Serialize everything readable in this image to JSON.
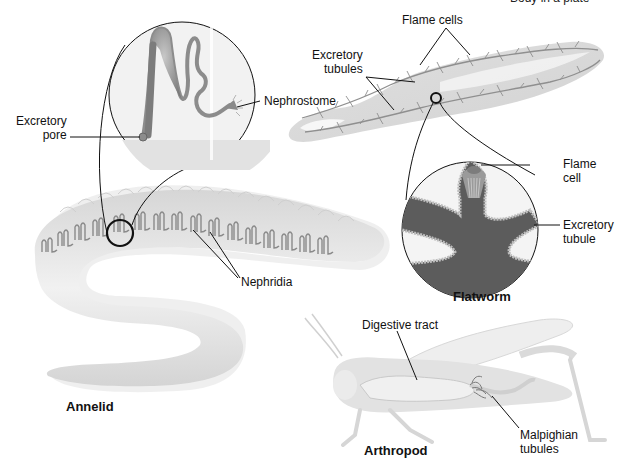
{
  "figure": {
    "top_cut_caption": "Body in a plate",
    "annelid": {
      "title": "Annelid",
      "labels": {
        "excretory_pore": [
          "Excretory",
          "pore"
        ],
        "nephrostome": "Nephrostome",
        "nephridia": "Nephridia"
      }
    },
    "flatworm": {
      "title": "Flatworm",
      "labels": {
        "flame_cells": "Flame cells",
        "excretory_tubules": [
          "Excretory",
          "tubules"
        ],
        "flame_cell": [
          "Flame",
          "cell"
        ],
        "excretory_tubule": [
          "Excretory",
          "tubule"
        ]
      }
    },
    "arthropod": {
      "title": "Arthropod",
      "labels": {
        "digestive_tract": "Digestive tract",
        "malpighian_tubules": [
          "Malpighian",
          "tubules"
        ]
      }
    },
    "colors": {
      "body_gray": "#d9d9d9",
      "body_light": "#ececec",
      "organ_gray": "#8c8c8c",
      "tubule_dark": "#6e6e6e",
      "line": "#111111"
    }
  }
}
